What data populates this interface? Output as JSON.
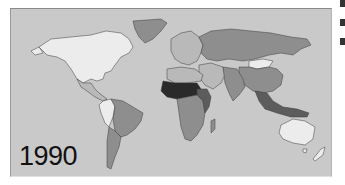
{
  "map": {
    "type": "world choropleth (grayscale)",
    "year_label": "1990",
    "palette": {
      "ocean": "#c9c9c9",
      "very_light": "#ececec",
      "light": "#b9b9b9",
      "mid": "#8e8e8e",
      "dark": "#5c5c5c",
      "darkest": "#2a2a2a",
      "border": "#3a3a3a"
    },
    "regions": [
      {
        "name": "North America (Canada/USA)",
        "shade": "very_light"
      },
      {
        "name": "Greenland",
        "shade": "mid"
      },
      {
        "name": "Mexico / Central America",
        "shade": "light"
      },
      {
        "name": "Brazil / Eastern South America",
        "shade": "mid"
      },
      {
        "name": "Andean South America",
        "shade": "very_light"
      },
      {
        "name": "Southern Cone",
        "shade": "mid"
      },
      {
        "name": "Europe",
        "shade": "light"
      },
      {
        "name": "Soviet Union",
        "shade": "mid"
      },
      {
        "name": "Mongolia",
        "shade": "very_light"
      },
      {
        "name": "China",
        "shade": "mid"
      },
      {
        "name": "Middle East",
        "shade": "light"
      },
      {
        "name": "South Asia",
        "shade": "mid"
      },
      {
        "name": "Sahel / West Africa",
        "shade": "darkest"
      },
      {
        "name": "North Africa",
        "shade": "light"
      },
      {
        "name": "Central / Southern Africa",
        "shade": "mid"
      },
      {
        "name": "East Africa",
        "shade": "dark"
      },
      {
        "name": "Southeast Asia / Indonesia",
        "shade": "dark"
      },
      {
        "name": "Australia",
        "shade": "very_light"
      },
      {
        "name": "New Zealand",
        "shade": "very_light"
      }
    ]
  }
}
